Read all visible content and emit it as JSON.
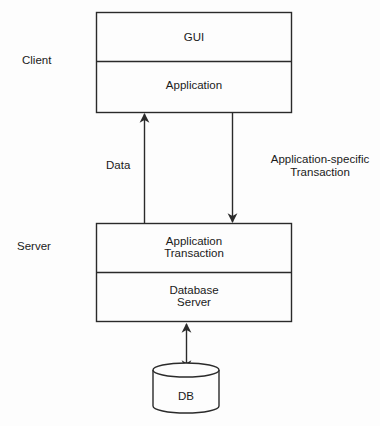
{
  "diagram": {
    "type": "client-server architecture",
    "colors": {
      "stroke": "#2a2a2a",
      "background": "#fdfdfd",
      "text": "#1a1a1a"
    },
    "tiers": {
      "client": {
        "label": "Client",
        "layers": [
          {
            "name": "GUI",
            "text": "GUI"
          },
          {
            "name": "Application",
            "text": "Application"
          }
        ]
      },
      "server": {
        "label": "Server",
        "layers": [
          {
            "name": "Application Transaction",
            "line1": "Application",
            "line2": "Transaction"
          },
          {
            "name": "Database Server",
            "line1": "Database",
            "line2": "Server"
          }
        ]
      },
      "database": {
        "label": "DB"
      }
    },
    "connections": [
      {
        "from": "Server",
        "to": "Client",
        "label": "Data",
        "direction": "up"
      },
      {
        "from": "Client",
        "to": "Server",
        "label_line1": "Application-specific",
        "label_line2": "Transaction",
        "direction": "down"
      },
      {
        "from": "Database Server",
        "to": "DB",
        "direction": "bidirectional"
      }
    ]
  }
}
